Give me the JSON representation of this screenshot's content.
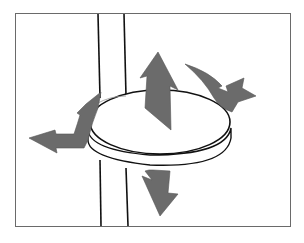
{
  "diagram": {
    "elements": [
      "frame",
      "pole",
      "disc",
      "arrow-up",
      "arrow-down",
      "arrow-rotate-left",
      "arrow-rotate-right"
    ],
    "labels": []
  },
  "colors": {
    "background": "#ffffff",
    "frame": "#6a6a6a",
    "outline": "#111111",
    "arrow_fill": "#6b6b6b",
    "disc_fill": "#ffffff"
  }
}
